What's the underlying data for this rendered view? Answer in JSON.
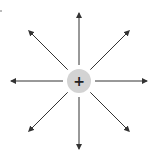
{
  "diagram": {
    "charge": {
      "sign": "+",
      "fill_color": "#d3d3d3",
      "symbol_color": "#222222"
    },
    "field_lines": {
      "count": 8,
      "direction": "outward",
      "angles_deg": [
        0,
        45,
        90,
        135,
        180,
        225,
        270,
        315
      ],
      "color": "#333333"
    }
  }
}
